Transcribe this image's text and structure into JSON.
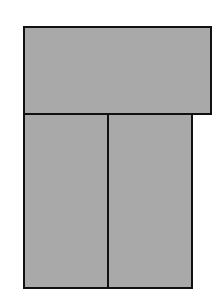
{
  "diagram": {
    "type": "block-partition",
    "background": "#ffffff",
    "fill_color": "#a9a9a9",
    "stroke_color": "#111111",
    "stroke_width": 2,
    "blocks": [
      {
        "id": "top",
        "x": 23,
        "y": 26,
        "width": 189,
        "height": 89
      },
      {
        "id": "bottom-left",
        "x": 23,
        "y": 113,
        "width": 86,
        "height": 176
      },
      {
        "id": "bottom-right",
        "x": 107,
        "y": 113,
        "width": 86,
        "height": 176
      }
    ]
  }
}
